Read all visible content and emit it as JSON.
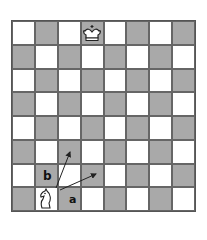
{
  "diagram": {
    "type": "chessboard",
    "files": 8,
    "ranks": 8,
    "top_left_color": "light",
    "colors": {
      "light": "#ffffff",
      "dark": "#a9a9a9",
      "line": "#555555",
      "arrow": "#222222"
    },
    "pieces": [
      {
        "name": "king",
        "color": "white",
        "square": "d8",
        "icon": "king-icon"
      },
      {
        "name": "knight",
        "color": "white",
        "square": "b1",
        "icon": "knight-icon"
      }
    ],
    "arrows": [
      {
        "label": "a",
        "from": [
          60,
          190
        ],
        "to": [
          96,
          174
        ]
      },
      {
        "label": "b",
        "from": [
          56,
          188
        ],
        "to": [
          70,
          152
        ]
      }
    ],
    "labels": {
      "a": "a",
      "b": "b"
    }
  }
}
